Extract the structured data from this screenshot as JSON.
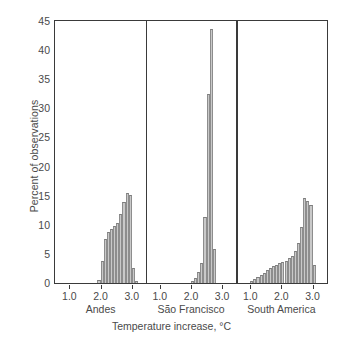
{
  "chart_data": {
    "type": "bar",
    "title": "",
    "xlabel": "Temperature increase, °C",
    "ylabel": "Percent of observations",
    "ylim": [
      0,
      45
    ],
    "ytick_labels": [
      "0",
      "5",
      "10",
      "15",
      "20",
      "25",
      "30",
      "35",
      "40",
      "45"
    ],
    "ytick_values": [
      0,
      5,
      10,
      15,
      20,
      25,
      30,
      35,
      40,
      45
    ],
    "xlim": [
      0.55,
      3.45
    ],
    "xtick_labels": [
      "1.0",
      "2.0",
      "3.0"
    ],
    "xtick_values": [
      1.0,
      2.0,
      3.0
    ],
    "grid": false,
    "legend": "none",
    "bin_width": 0.1,
    "bar_fill": "#c9c9c9",
    "bar_edge": "#7d7d7d",
    "axis_color": "#3a3a3a",
    "panels": [
      {
        "name": "Andes",
        "x": [
          1.95,
          2.05,
          2.15,
          2.25,
          2.35,
          2.45,
          2.55,
          2.65,
          2.75,
          2.85,
          2.95,
          3.05,
          3.15
        ],
        "values": [
          0.4,
          3.8,
          7.5,
          8.7,
          9.3,
          9.8,
          10.3,
          11.9,
          13.8,
          15.4,
          15.1,
          2.6,
          0.3
        ]
      },
      {
        "name": "São Francisco",
        "x": [
          2.05,
          2.15,
          2.25,
          2.35,
          2.45,
          2.55,
          2.65,
          2.75
        ],
        "values": [
          0.3,
          0.8,
          1.9,
          3.4,
          11.3,
          32.5,
          43.7,
          5.8
        ]
      },
      {
        "name": "South America",
        "x": [
          1.05,
          1.15,
          1.25,
          1.35,
          1.45,
          1.55,
          1.65,
          1.75,
          1.85,
          1.95,
          2.05,
          2.15,
          2.25,
          2.35,
          2.45,
          2.55,
          2.65,
          2.75,
          2.85,
          2.95,
          3.05
        ],
        "values": [
          0.3,
          0.6,
          0.9,
          1.3,
          1.7,
          2.2,
          2.6,
          2.9,
          3.1,
          3.4,
          3.5,
          3.8,
          4.2,
          4.6,
          5.4,
          6.8,
          9.6,
          14.6,
          14.0,
          13.3,
          3.1
        ]
      }
    ]
  }
}
